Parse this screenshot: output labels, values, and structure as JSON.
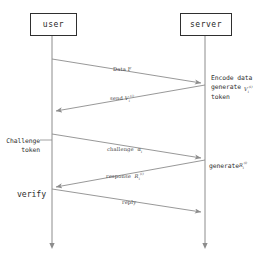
{
  "diagram": {
    "type": "uml-sequence-diagram",
    "title": "",
    "stroke_color": "#8c8c8c",
    "box_border_color": "#2f2f2f",
    "text_color": "#2e2e2e",
    "background": "#ffffff"
  },
  "actors": [
    {
      "id": "user",
      "label": "user",
      "lifeline_x": 52
    },
    {
      "id": "server",
      "label": "server",
      "lifeline_x": 205
    }
  ],
  "messages": [
    {
      "id": "m1",
      "label": "Data F",
      "from": "user",
      "to": "server",
      "math": ""
    },
    {
      "id": "m2",
      "label": "send",
      "from": "server",
      "to": "user",
      "math": "V"
    },
    {
      "id": "m3",
      "label": "challenge",
      "from": "user",
      "to": "server",
      "math": "α"
    },
    {
      "id": "m4",
      "label": "response",
      "from": "server",
      "to": "user",
      "math": "R"
    },
    {
      "id": "m5",
      "label": "reply",
      "from": "user",
      "to": "server",
      "math": ""
    }
  ],
  "notes": [
    {
      "id": "n1",
      "text": "Encode data\ngenerate\ntoken",
      "side": "right",
      "actor": "server",
      "math": "V"
    },
    {
      "id": "n2",
      "text": "Challenge\ntoken",
      "side": "left",
      "actor": "user",
      "math": ""
    },
    {
      "id": "n3",
      "text": "generate",
      "side": "right",
      "actor": "server",
      "math": "R"
    },
    {
      "id": "n4",
      "text": "verify",
      "side": "left",
      "actor": "user",
      "math": ""
    }
  ],
  "superscripts": {
    "v_sup": "(i)",
    "v_sub": "i",
    "r_sup": "(i)",
    "r_sub": "i",
    "alpha_sub": "i"
  }
}
